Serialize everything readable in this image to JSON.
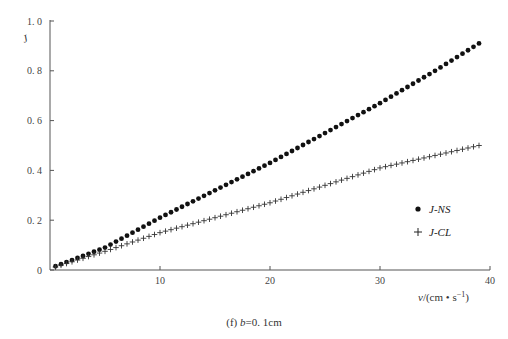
{
  "caption": {
    "prefix": "(f) ",
    "var": "b",
    "suffix": "=0. 1cm"
  },
  "chart_data": {
    "type": "scatter",
    "title": "",
    "xlabel": "v/(cm • s⁻¹)",
    "ylabel": "J",
    "xlim": [
      0,
      40
    ],
    "ylim": [
      0,
      1.0
    ],
    "xticks": [
      10,
      20,
      30,
      40
    ],
    "xtick_labels": [
      "10",
      "20",
      "30",
      "40"
    ],
    "yticks": [
      0,
      0.2,
      0.4,
      0.6,
      0.8,
      1.0
    ],
    "ytick_labels": [
      "0",
      "0. 2",
      "0. 4",
      "0. 6",
      "0. 8",
      "1. 0"
    ],
    "grid": false,
    "legend_position": "right-middle",
    "series": [
      {
        "name": "J-NS",
        "marker": "dot",
        "anchors": {
          "x": [
            0.5,
            5,
            10,
            15,
            20,
            25,
            30,
            35,
            39
          ],
          "y": [
            0.015,
            0.09,
            0.21,
            0.32,
            0.43,
            0.55,
            0.67,
            0.8,
            0.91
          ]
        }
      },
      {
        "name": "J-CL",
        "marker": "plus",
        "anchors": {
          "x": [
            0.5,
            5,
            10,
            15,
            20,
            25,
            30,
            35,
            39
          ],
          "y": [
            0.012,
            0.075,
            0.15,
            0.21,
            0.27,
            0.34,
            0.41,
            0.46,
            0.5
          ]
        }
      }
    ],
    "x_step": 0.5
  }
}
